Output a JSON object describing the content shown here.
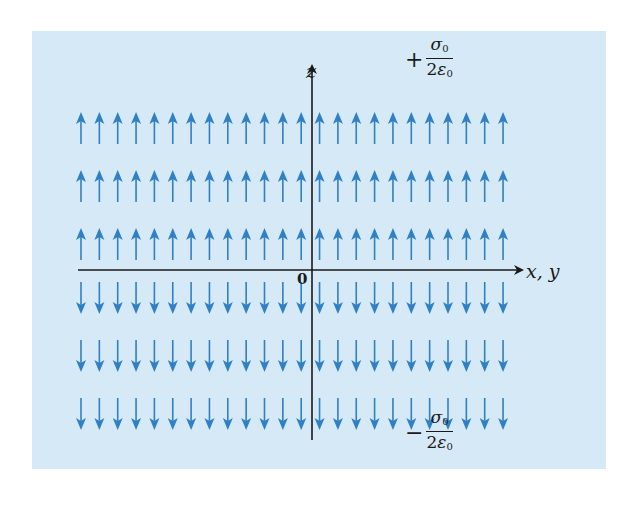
{
  "figure": {
    "background_color": "#d5e9f6",
    "arrow_color": "#2f80c4",
    "axis_color": "#1a1a1a"
  },
  "axes": {
    "vertical_label": "z",
    "horizontal_label": "x, y",
    "origin_label": "0"
  },
  "field_labels": {
    "upper": {
      "sign": "+",
      "numerator": "σ",
      "numerator_sub": "0",
      "denominator_coef": "2",
      "denominator_sym": "ε",
      "denominator_sub": "0"
    },
    "lower": {
      "sign": "−",
      "numerator": "σ",
      "numerator_sub": "0",
      "denominator_coef": "2",
      "denominator_sym": "ε",
      "denominator_sub": "0"
    }
  },
  "arrow_grid": {
    "columns": 24,
    "rows_above": 3,
    "rows_below": 3,
    "direction_above": "up",
    "direction_below": "down"
  }
}
